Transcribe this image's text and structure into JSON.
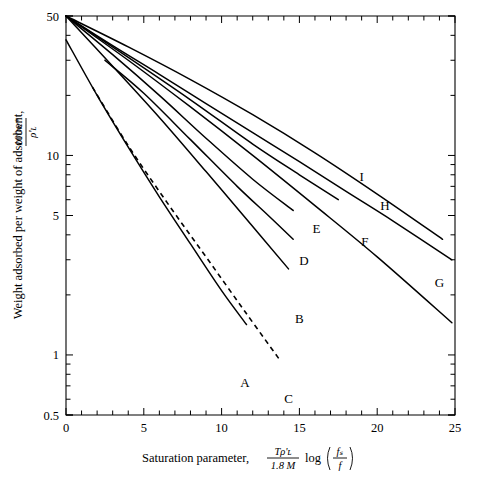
{
  "figure": {
    "title": "",
    "background_color": "#ffffff",
    "line_color": "#000000"
  },
  "axes": {
    "y": {
      "label_prefix": "Weight adsorbed per weight of adsorbent,",
      "label_fraction_numerator": "100w*",
      "label_fraction_denominator": "ρ'ʟ",
      "scale": "log",
      "ticks": [
        "50",
        "10",
        "5",
        "1",
        "0.5"
      ],
      "range": [
        0.5,
        50
      ]
    },
    "x": {
      "label_prefix": "Saturation parameter,",
      "label_fraction_numerator": "Tρ'ʟ",
      "label_fraction_denominator": "1.8 M",
      "label_log": "log",
      "label_arg_numerator": "fₛ",
      "label_arg_denominator": "f",
      "scale": "linear",
      "ticks": [
        "0",
        "5",
        "10",
        "15",
        "20",
        "25"
      ],
      "range": [
        0,
        25
      ]
    }
  },
  "chart_data": {
    "type": "line",
    "title": "",
    "xlabel": "Saturation parameter, Tρ'L/(1.8 M) log(fs/f)",
    "ylabel": "Weight adsorbed per weight of adsorbent, 100w*/ρ'L",
    "xscale": "linear",
    "yscale": "log",
    "xlim": [
      0,
      25
    ],
    "ylim": [
      0.5,
      50
    ],
    "xticks": [
      0,
      5,
      10,
      15,
      20,
      25
    ],
    "yticks": [
      0.5,
      1,
      5,
      10,
      50
    ],
    "grid": false,
    "legend": "inline-curve-labels",
    "series": [
      {
        "name": "A",
        "style": "solid",
        "label": "A",
        "label_x": 11.5,
        "label_y": 0.72,
        "points": [
          {
            "x": 0.0,
            "y": 38.0
          },
          {
            "x": 2.0,
            "y": 20.0
          },
          {
            "x": 4.0,
            "y": 11.0
          },
          {
            "x": 6.0,
            "y": 6.2
          },
          {
            "x": 8.0,
            "y": 3.6
          },
          {
            "x": 10.0,
            "y": 2.1
          },
          {
            "x": 11.6,
            "y": 1.42
          }
        ]
      },
      {
        "name": "B",
        "style": "solid",
        "label": "B",
        "label_x": 15.0,
        "label_y": 1.52,
        "points": [
          {
            "x": 0.0,
            "y": 50.0
          },
          {
            "x": 3.0,
            "y": 28.0
          },
          {
            "x": 6.0,
            "y": 15.5
          },
          {
            "x": 9.0,
            "y": 8.3
          },
          {
            "x": 12.0,
            "y": 4.4
          },
          {
            "x": 14.3,
            "y": 2.7
          }
        ]
      },
      {
        "name": "C",
        "style": "dashed",
        "label": "C",
        "label_x": 14.3,
        "label_y": 0.6,
        "points": [
          {
            "x": 1.7,
            "y": 22.0
          },
          {
            "x": 4.0,
            "y": 11.2
          },
          {
            "x": 6.5,
            "y": 5.8
          },
          {
            "x": 9.0,
            "y": 3.1
          },
          {
            "x": 11.5,
            "y": 1.65
          },
          {
            "x": 13.8,
            "y": 0.93
          }
        ]
      },
      {
        "name": "D",
        "style": "solid",
        "label": "D",
        "label_x": 15.3,
        "label_y": 2.95,
        "points": [
          {
            "x": 2.5,
            "y": 30.0
          },
          {
            "x": 5.0,
            "y": 20.5
          },
          {
            "x": 8.0,
            "y": 12.0
          },
          {
            "x": 11.0,
            "y": 7.0
          },
          {
            "x": 13.0,
            "y": 5.0
          },
          {
            "x": 14.6,
            "y": 3.8
          }
        ]
      },
      {
        "name": "E",
        "style": "solid",
        "label": "E",
        "label_x": 16.1,
        "label_y": 4.3,
        "points": [
          {
            "x": 0.0,
            "y": 50.0
          },
          {
            "x": 3.0,
            "y": 32.0
          },
          {
            "x": 6.0,
            "y": 20.0
          },
          {
            "x": 9.0,
            "y": 12.2
          },
          {
            "x": 12.0,
            "y": 7.6
          },
          {
            "x": 14.6,
            "y": 5.3
          }
        ]
      },
      {
        "name": "F",
        "style": "solid",
        "label": "F",
        "label_x": 19.2,
        "label_y": 3.7,
        "points": [
          {
            "x": 0.0,
            "y": 50.0
          },
          {
            "x": 4.0,
            "y": 30.0
          },
          {
            "x": 8.0,
            "y": 17.5
          },
          {
            "x": 12.0,
            "y": 10.0
          },
          {
            "x": 16.0,
            "y": 5.6
          },
          {
            "x": 20.0,
            "y": 3.1
          },
          {
            "x": 24.8,
            "y": 1.45
          }
        ]
      },
      {
        "name": "G",
        "style": "solid",
        "label": "G",
        "label_x": 24.0,
        "label_y": 2.3,
        "points": [
          {
            "x": 0.0,
            "y": 50.0
          },
          {
            "x": 4.0,
            "y": 35.0
          },
          {
            "x": 8.0,
            "y": 24.0
          },
          {
            "x": 12.0,
            "y": 16.0
          },
          {
            "x": 16.0,
            "y": 10.3
          },
          {
            "x": 20.0,
            "y": 6.4
          },
          {
            "x": 24.2,
            "y": 3.8
          }
        ]
      },
      {
        "name": "H",
        "style": "solid",
        "label": "H",
        "label_x": 20.5,
        "label_y": 5.6,
        "points": [
          {
            "x": 0.0,
            "y": 50.0
          },
          {
            "x": 4.0,
            "y": 31.0
          },
          {
            "x": 8.0,
            "y": 19.0
          },
          {
            "x": 12.0,
            "y": 11.4
          },
          {
            "x": 15.0,
            "y": 8.0
          },
          {
            "x": 17.5,
            "y": 6.0
          }
        ]
      },
      {
        "name": "I",
        "style": "solid",
        "label": "I",
        "label_x": 19.0,
        "label_y": 7.8,
        "points": [
          {
            "x": 0.0,
            "y": 50.0
          },
          {
            "x": 3.0,
            "y": 35.5
          },
          {
            "x": 6.0,
            "y": 25.5
          },
          {
            "x": 9.0,
            "y": 18.2
          },
          {
            "x": 12.0,
            "y": 13.0
          },
          {
            "x": 15.0,
            "y": 9.3
          },
          {
            "x": 18.0,
            "y": 6.6
          },
          {
            "x": 21.0,
            "y": 4.7
          },
          {
            "x": 24.8,
            "y": 3.0
          }
        ]
      }
    ]
  }
}
